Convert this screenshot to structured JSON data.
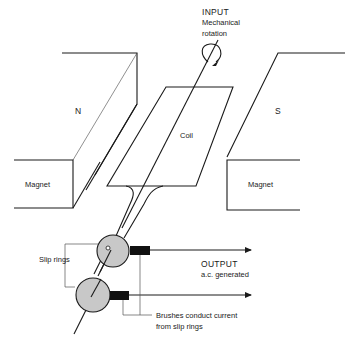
{
  "diagram": {
    "labels": {
      "input_title": "INPUT",
      "input_line1": "Mechanical",
      "input_line2": "rotation",
      "north_pole": "N",
      "south_pole": "S",
      "coil": "Coil",
      "magnet_left": "Magnet",
      "magnet_right": "Magnet",
      "slip_rings": "Slip rings",
      "output_title": "OUTPUT",
      "output_sub": "a.c. generated",
      "brushes_line1": "Brushes conduct current",
      "brushes_line2": "from slip rings"
    },
    "icons": {
      "rotation": "curved-rotation-arrow-icon",
      "output_arrows": "right-arrow-icon"
    },
    "colors": {
      "line": "#1a1a1a",
      "slip_ring_fill": "#c8c8c8",
      "brush_fill": "#111111",
      "background": "#ffffff"
    }
  }
}
